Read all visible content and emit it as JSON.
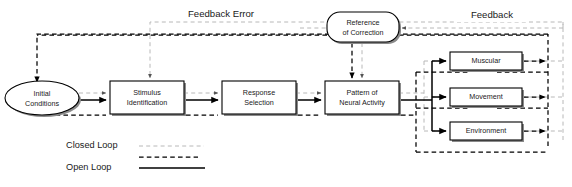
{
  "diagram": {
    "title_labels": [
      {
        "id": "feedback-error",
        "text": "Feedback Error",
        "x": 221,
        "y": 14
      },
      {
        "id": "feedback",
        "text": "Feedback",
        "x": 492,
        "y": 15
      }
    ],
    "nodes": [
      {
        "id": "initial-conditions",
        "shape": "ellipse",
        "line1": "Initial",
        "line2": "Conditions",
        "cx": 42,
        "cy": 98,
        "rx": 37,
        "ry": 17
      },
      {
        "id": "stimulus-identification",
        "shape": "rect",
        "line1": "Stimulus",
        "line2": "Identification",
        "x": 110,
        "y": 81,
        "w": 74,
        "h": 33
      },
      {
        "id": "response-selection",
        "shape": "rect",
        "line1": "Response",
        "line2": "Selection",
        "x": 222,
        "y": 81,
        "w": 74,
        "h": 33
      },
      {
        "id": "pattern-of-neural-activity",
        "shape": "rect",
        "line1": "Pattern of",
        "line2": "Neural Activity",
        "x": 325,
        "y": 81,
        "w": 74,
        "h": 33
      },
      {
        "id": "reference-of-correction",
        "shape": "roundrect",
        "line1": "Reference",
        "line2": "of Correction",
        "x": 327,
        "y": 12,
        "w": 72,
        "h": 30
      },
      {
        "id": "muscular",
        "shape": "rect",
        "line1": "Muscular",
        "line2": "",
        "x": 450,
        "y": 52,
        "w": 72,
        "h": 18
      },
      {
        "id": "movement",
        "shape": "rect",
        "line1": "Movement",
        "line2": "",
        "x": 450,
        "y": 88,
        "w": 72,
        "h": 18
      },
      {
        "id": "environment",
        "shape": "rect",
        "line1": "Environment",
        "line2": "",
        "x": 450,
        "y": 122,
        "w": 72,
        "h": 18
      }
    ],
    "legend": {
      "items": [
        {
          "id": "closed-loop",
          "label": "Closed Loop",
          "style": "closed-loop",
          "label_x": 66,
          "label_y": 146,
          "line_x1": 139,
          "line_x2": 204,
          "line_y": 146
        },
        {
          "id": "open-loop",
          "label": "Open Loop",
          "style": "open-loop",
          "label_x": 66,
          "label_y": 168,
          "dash_x1": 139,
          "dash_x2": 198,
          "dash_y": 157,
          "solid_x1": 139,
          "solid_x2": 205,
          "solid_y": 168
        }
      ]
    },
    "colors": {
      "closed_loop": "#b8b8b8",
      "open_loop": "#000000",
      "node_fill": "#ffffff",
      "node_stroke": "#000000",
      "shadow": "#8a8a8a",
      "text": "#1a1a1a",
      "background": "#ffffff"
    }
  }
}
